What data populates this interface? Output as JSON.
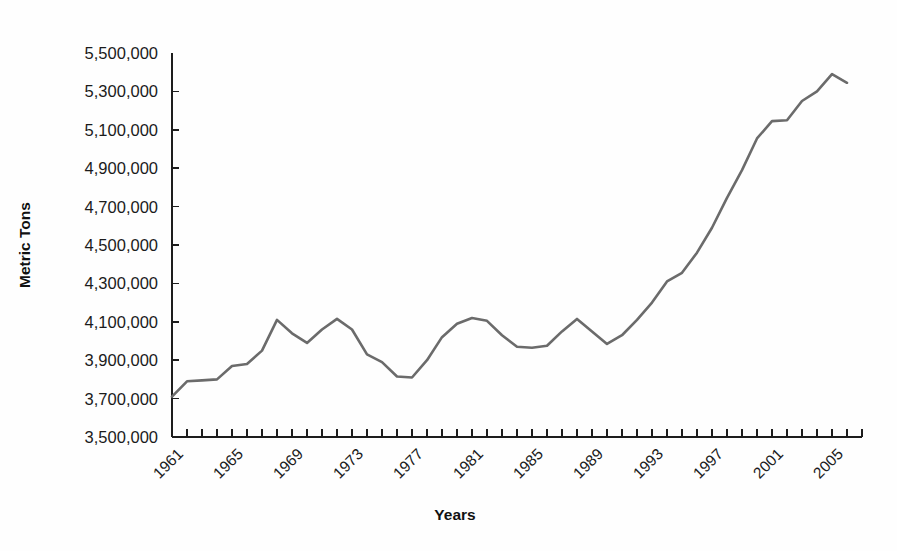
{
  "chart_data": {
    "type": "line",
    "title": "",
    "xlabel": "Years",
    "ylabel": "Metric Tons",
    "grid": false,
    "legend": "none",
    "line_color": "#6b6b6b",
    "axis_color": "#1d1d1d",
    "background_color": "#fefefe",
    "xlim": [
      1961,
      2007
    ],
    "ylim": [
      3500000,
      5500000
    ],
    "ytick_step": 200000,
    "xtick_label_step": 4,
    "ytick_labels": [
      "5,500,000",
      "5,300,000",
      "5,100,000",
      "4,900,000",
      "4,700,000",
      "4,500,000",
      "4,300,000",
      "4,100,000",
      "3,900,000",
      "3,700,000",
      "3,500,000"
    ],
    "ytick_values": [
      5500000,
      5300000,
      5100000,
      4900000,
      4700000,
      4500000,
      4300000,
      4100000,
      3900000,
      3700000,
      3500000
    ],
    "xtick_labels": [
      "1961",
      "1965",
      "1969",
      "1973",
      "1977",
      "1981",
      "1985",
      "1989",
      "1993",
      "1997",
      "2001",
      "2005"
    ],
    "xtick_label_values": [
      1961,
      1965,
      1969,
      1973,
      1977,
      1981,
      1985,
      1989,
      1993,
      1997,
      2001,
      2005
    ],
    "x": [
      1961,
      1962,
      1963,
      1964,
      1965,
      1966,
      1967,
      1968,
      1969,
      1970,
      1971,
      1972,
      1973,
      1974,
      1975,
      1976,
      1977,
      1978,
      1979,
      1980,
      1981,
      1982,
      1983,
      1984,
      1985,
      1986,
      1987,
      1988,
      1989,
      1990,
      1991,
      1992,
      1993,
      1994,
      1995,
      1996,
      1997,
      1998,
      1999,
      2000,
      2001,
      2002,
      2003,
      2004,
      2005,
      2006
    ],
    "values": [
      3710000,
      3790000,
      3795000,
      3800000,
      3870000,
      3880000,
      3950000,
      4110000,
      4040000,
      3990000,
      4060000,
      4115000,
      4060000,
      3930000,
      3890000,
      3815000,
      3810000,
      3900000,
      4020000,
      4090000,
      4120000,
      4105000,
      4030000,
      3970000,
      3965000,
      3975000,
      4050000,
      4115000,
      4050000,
      3985000,
      4030000,
      4110000,
      4200000,
      4310000,
      4355000,
      4460000,
      4590000,
      4745000,
      4890000,
      5055000,
      5145000,
      5150000,
      5250000,
      5300000,
      5390000,
      5345000
    ],
    "series_name": "Metric Tons"
  }
}
